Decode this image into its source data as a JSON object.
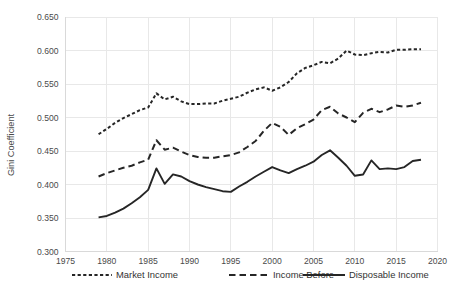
{
  "chart_data": {
    "type": "line",
    "title": "",
    "xlabel": "",
    "ylabel": "Gini Coefficient",
    "xlim": [
      1975,
      2020
    ],
    "ylim": [
      0.3,
      0.65
    ],
    "xticks": [
      "1975",
      "1980",
      "1985",
      "1990",
      "1995",
      "2000",
      "2005",
      "2010",
      "2015",
      "2020"
    ],
    "yticks": [
      "0.300",
      "0.350",
      "0.400",
      "0.450",
      "0.500",
      "0.550",
      "0.600",
      "0.650"
    ],
    "grid": true,
    "legend_position": "bottom",
    "x": [
      1979,
      1980,
      1981,
      1982,
      1983,
      1984,
      1985,
      1986,
      1987,
      1988,
      1989,
      1990,
      1991,
      1992,
      1993,
      1994,
      1995,
      1996,
      1997,
      1998,
      1999,
      2000,
      2001,
      2002,
      2003,
      2004,
      2005,
      2006,
      2007,
      2008,
      2009,
      2010,
      2011,
      2012,
      2013,
      2014,
      2015,
      2016,
      2017,
      2018
    ],
    "series": [
      {
        "name": "Market Income",
        "style": "dotted",
        "values": [
          0.475,
          0.483,
          0.492,
          0.499,
          0.505,
          0.511,
          0.515,
          0.536,
          0.527,
          0.531,
          0.524,
          0.52,
          0.52,
          0.521,
          0.521,
          0.525,
          0.528,
          0.531,
          0.537,
          0.542,
          0.545,
          0.54,
          0.545,
          0.553,
          0.566,
          0.574,
          0.578,
          0.583,
          0.581,
          0.588,
          0.6,
          0.594,
          0.593,
          0.596,
          0.598,
          0.597,
          0.601,
          0.601,
          0.602,
          0.602
        ]
      },
      {
        "name": "Income Before",
        "style": "dashed",
        "values": [
          0.412,
          0.417,
          0.421,
          0.425,
          0.428,
          0.433,
          0.437,
          0.466,
          0.452,
          0.455,
          0.449,
          0.444,
          0.441,
          0.44,
          0.44,
          0.442,
          0.444,
          0.448,
          0.456,
          0.465,
          0.48,
          0.492,
          0.486,
          0.474,
          0.484,
          0.49,
          0.497,
          0.511,
          0.516,
          0.506,
          0.5,
          0.493,
          0.507,
          0.513,
          0.508,
          0.512,
          0.518,
          0.516,
          0.518,
          0.522
        ]
      },
      {
        "name": "Disposable Income",
        "style": "solid",
        "values": [
          0.351,
          0.353,
          0.358,
          0.364,
          0.372,
          0.381,
          0.392,
          0.424,
          0.401,
          0.415,
          0.412,
          0.405,
          0.4,
          0.396,
          0.393,
          0.39,
          0.389,
          0.397,
          0.404,
          0.412,
          0.419,
          0.426,
          0.421,
          0.417,
          0.423,
          0.428,
          0.434,
          0.444,
          0.451,
          0.44,
          0.428,
          0.413,
          0.415,
          0.436,
          0.423,
          0.424,
          0.423,
          0.426,
          0.435,
          0.437
        ]
      }
    ]
  },
  "legend": {
    "items": [
      {
        "label": "Market Income",
        "style": "dotted"
      },
      {
        "label": "Income Before",
        "style": "dashed"
      },
      {
        "label": "Disposable Income",
        "style": "solid"
      }
    ]
  }
}
